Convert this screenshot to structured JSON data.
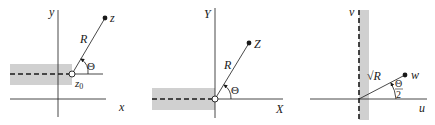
{
  "panels": [
    {
      "name": "z-plane",
      "axis_x_label": "x",
      "axis_y_label": "y",
      "point_label": "z",
      "origin_label": "z",
      "origin_subscript": "0",
      "radius_label": "R",
      "angle_label": "Θ"
    },
    {
      "name": "Z-plane",
      "axis_x_label": "X",
      "axis_y_label": "Y",
      "point_label": "Z",
      "radius_label": "R",
      "angle_label": "Θ"
    },
    {
      "name": "w-plane",
      "axis_x_label": "u",
      "axis_y_label": "v",
      "point_label": "w",
      "radius_label": "√R",
      "angle_numerator": "Θ",
      "angle_denominator": "2"
    }
  ],
  "colors": {
    "line": "#1a1a1a",
    "shade": "#d0d0d0"
  }
}
